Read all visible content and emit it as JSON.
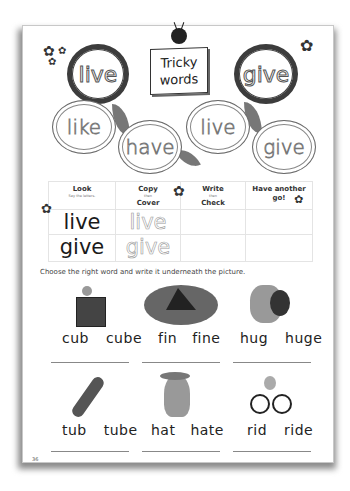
{
  "header": {
    "title_line1": "Tricky",
    "title_line2": "words",
    "dark_clouds": [
      "live",
      "give"
    ],
    "light_clouds": [
      "like",
      "have",
      "live",
      "give"
    ]
  },
  "practice_table": {
    "columns": [
      {
        "main": "Look",
        "sub": "Say the letters."
      },
      {
        "main": "Copy",
        "sub": "then",
        "main2": "Cover"
      },
      {
        "main": "Write",
        "sub": "then",
        "main2": "Check"
      },
      {
        "main": "Have another",
        "main2": "go!"
      }
    ],
    "rows": [
      {
        "look": "live",
        "copy": "live",
        "write": "",
        "again": ""
      },
      {
        "look": "give",
        "copy": "give",
        "write": "",
        "again": ""
      }
    ]
  },
  "exercise": {
    "instruction": "Choose the right word and write it underneath the picture.",
    "items": [
      {
        "picture": "cube-with-mouse",
        "options": [
          "cub",
          "cube"
        ]
      },
      {
        "picture": "shark-fin",
        "options": [
          "fin",
          "fine"
        ]
      },
      {
        "picture": "mouse-hugging-bee",
        "options": [
          "hug",
          "huge"
        ]
      },
      {
        "picture": "tube",
        "options": [
          "tub",
          "tube"
        ]
      },
      {
        "picture": "dog-with-hat",
        "options": [
          "hat",
          "hate"
        ]
      },
      {
        "picture": "mouse-on-bicycle",
        "options": [
          "rid",
          "ride"
        ]
      }
    ]
  },
  "footer": {
    "page_number": "36"
  },
  "colors": {
    "ink": "#222222",
    "cloud_dark": "#3c3c3c",
    "leaf": "#777777",
    "grid_line": "#e4e4e4"
  }
}
